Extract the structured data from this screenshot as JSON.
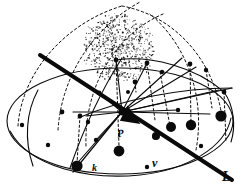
{
  "figure": {
    "background_color": "#ffffff",
    "ink_color": "#0a0a0a",
    "width": 241,
    "height": 185
  },
  "labels": [
    {
      "id": "point-p",
      "text": "P",
      "x": 117,
      "y": 128,
      "size": 11,
      "rotate": -8
    },
    {
      "id": "vector-v",
      "text": "v",
      "x": 152,
      "y": 157,
      "size": 12,
      "rotate": 0
    },
    {
      "id": "line-k",
      "text": "k",
      "x": 92,
      "y": 163,
      "size": 10,
      "rotate": 0
    },
    {
      "id": "line-l",
      "text": "L",
      "x": 222,
      "y": 170,
      "size": 14,
      "rotate": 0
    }
  ],
  "geometry": {
    "apex": {
      "x": 122,
      "y": 4
    },
    "center_point_p": {
      "x": 122,
      "y": 112
    },
    "base_ellipse": {
      "cx": 120,
      "cy": 121,
      "rx": 113,
      "ry": 53
    },
    "dome_outline": {
      "cx": 120,
      "cy": 121,
      "rx": 113,
      "ry": 117
    },
    "line_l": {
      "x1": 40,
      "y1": 55,
      "x2": 232,
      "y2": 180,
      "stroke_width": 4
    },
    "line_k": {
      "x1": 122,
      "y1": 112,
      "x2": 73,
      "y2": 172
    },
    "arrow_head": {
      "x": 122,
      "y": 112,
      "angle": 33
    }
  },
  "elements": {
    "solid_arcs": [
      {
        "name": "meridian-arc-right-front",
        "d": "M 10 131 C 30 168 90 180 140 175 C 186 170 225 148 231 118"
      },
      {
        "name": "meridian-arc-left",
        "d": "M 38 90 C 26 112 24 140 33 166"
      },
      {
        "name": "ridge-arc-upper",
        "d": "M 116 60 C 150 55 196 67 224 92"
      },
      {
        "name": "ridge-arc-mid",
        "d": "M 78 118 C 120 100 180 88 232 88"
      },
      {
        "name": "meridian-arc-center",
        "d": "M 122 58 C 104 86 86 122 70 168"
      },
      {
        "name": "meridian-arc-right-edge",
        "d": "M 224 92 C 234 106 236 126 231 142"
      }
    ],
    "dashed_arcs": [
      {
        "name": "dashed-dome-left",
        "d": "M 18 126 C 22 70 68 22 122 6"
      },
      {
        "name": "dashed-dome-right",
        "d": "M 122 6 C 176 16 215 62 222 118"
      },
      {
        "name": "dashed-crest-a",
        "d": "M 58 130 C 62 72 96 26 140 2"
      },
      {
        "name": "dashed-crest-b",
        "d": "M 86 146 C 84 86 116 34 163 14"
      },
      {
        "name": "dashed-crest-c",
        "d": "M 196 150 C 206 96 186 44 150 14"
      }
    ],
    "rays_from_p": [
      {
        "name": "ray-1",
        "x2": 116,
        "y2": 60
      },
      {
        "name": "ray-2",
        "x2": 147,
        "y2": 63
      },
      {
        "name": "ray-3",
        "x2": 182,
        "y2": 58
      },
      {
        "name": "ray-4",
        "x2": 196,
        "y2": 67
      },
      {
        "name": "ray-5",
        "x2": 219,
        "y2": 90
      },
      {
        "name": "ray-6",
        "x2": 232,
        "y2": 88
      },
      {
        "name": "ray-7",
        "x2": 210,
        "y2": 114
      },
      {
        "name": "ray-8",
        "x2": 178,
        "y2": 110
      },
      {
        "name": "ray-9",
        "x2": 99,
        "y2": 93
      },
      {
        "name": "ray-10",
        "x2": 73,
        "y2": 112
      },
      {
        "name": "ray-11",
        "x2": 73,
        "y2": 168
      },
      {
        "name": "ray-12",
        "x2": 96,
        "y2": 140
      },
      {
        "name": "ray-13",
        "x2": 86,
        "y2": 116
      }
    ],
    "drop_lines": [
      {
        "name": "drop-1",
        "x1": 116,
        "y1": 60,
        "x2": 119,
        "y2": 146
      },
      {
        "name": "drop-2",
        "x1": 147,
        "y1": 63,
        "x2": 155,
        "y2": 120
      },
      {
        "name": "drop-3",
        "x1": 160,
        "y1": 72,
        "x2": 170,
        "y2": 126
      },
      {
        "name": "drop-4",
        "x1": 190,
        "y1": 64,
        "x2": 191,
        "y2": 123
      },
      {
        "name": "drop-5",
        "x1": 206,
        "y1": 70,
        "x2": 212,
        "y2": 108
      },
      {
        "name": "drop-6",
        "x1": 224,
        "y1": 92,
        "x2": 226,
        "y2": 142
      },
      {
        "name": "drop-7",
        "x1": 80,
        "y1": 116,
        "x2": 77,
        "y2": 163
      },
      {
        "name": "drop-8",
        "x1": 135,
        "y1": 82,
        "x2": 136,
        "y2": 92
      }
    ],
    "large_dots": [
      {
        "name": "large-dot-1",
        "x": 119,
        "y": 151,
        "r": 5.4
      },
      {
        "name": "large-dot-2",
        "x": 77,
        "y": 166,
        "r": 5.6
      },
      {
        "name": "large-dot-3",
        "x": 156,
        "y": 136,
        "r": 4.0
      },
      {
        "name": "large-dot-4",
        "x": 171,
        "y": 127,
        "r": 5.0
      },
      {
        "name": "large-dot-5",
        "x": 191,
        "y": 125,
        "r": 5.2
      },
      {
        "name": "large-dot-6",
        "x": 221,
        "y": 116,
        "r": 5.6
      }
    ],
    "medium_dots": [
      {
        "name": "dot-arc-1",
        "x": 116,
        "y": 60,
        "r": 2.4
      },
      {
        "name": "dot-arc-2",
        "x": 147,
        "y": 63,
        "r": 2.4
      },
      {
        "name": "dot-arc-3",
        "x": 162,
        "y": 72,
        "r": 2.2
      },
      {
        "name": "dot-arc-4",
        "x": 190,
        "y": 64,
        "r": 2.4
      },
      {
        "name": "dot-arc-5",
        "x": 206,
        "y": 70,
        "r": 2.2
      },
      {
        "name": "dot-arc-6",
        "x": 224,
        "y": 92,
        "r": 2.4
      },
      {
        "name": "dot-arc-7",
        "x": 178,
        "y": 110,
        "r": 2.2
      },
      {
        "name": "dot-arc-8",
        "x": 135,
        "y": 82,
        "r": 2.4
      },
      {
        "name": "dot-arc-9",
        "x": 99,
        "y": 93,
        "r": 2.4
      },
      {
        "name": "dot-arc-10",
        "x": 80,
        "y": 116,
        "r": 2.4
      },
      {
        "name": "dot-arc-11",
        "x": 96,
        "y": 140,
        "r": 2.2
      },
      {
        "name": "dot-arc-12",
        "x": 88,
        "y": 122,
        "r": 2.2
      },
      {
        "name": "dot-line-1",
        "x": 155,
        "y": 137,
        "r": 2.6
      }
    ],
    "small_dots": [
      {
        "name": "dot-base-1",
        "x": 22,
        "y": 125,
        "r": 2.2
      },
      {
        "name": "dot-base-2",
        "x": 62,
        "y": 112,
        "r": 2.4
      },
      {
        "name": "dot-base-3",
        "x": 48,
        "y": 145,
        "r": 2.2
      },
      {
        "name": "dot-base-4",
        "x": 147,
        "y": 167,
        "r": 2.2
      },
      {
        "name": "dot-base-5",
        "x": 201,
        "y": 146,
        "r": 2.2
      },
      {
        "name": "dot-base-6",
        "x": 128,
        "y": 92,
        "r": 2.0
      }
    ],
    "stipple_cloud": {
      "name": "stipple-cloud",
      "cx": 118,
      "cy": 48,
      "rx": 36,
      "ry": 34,
      "point_count": 620,
      "seed": 20240117
    }
  }
}
